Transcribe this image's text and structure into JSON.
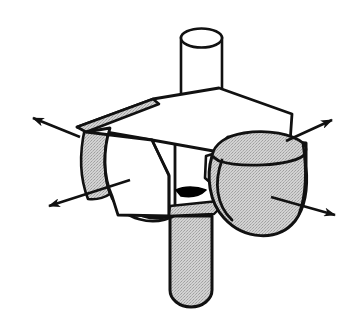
{
  "figure": {
    "background_color": "#ffffff",
    "outline_color": "#111111",
    "shade_fill_color": "#cccccc",
    "highlight_fill_color": "#ffffff",
    "notch_fill_color": "#000000",
    "canvas": {
      "width": 364,
      "height": 324
    },
    "parts": [
      {
        "name": "top-cylinder",
        "label": "Top cylindrical boss",
        "fill": "#ffffff",
        "shaded": false,
        "description": "Vertical cylinder rising from the top face of the block, open elliptical top rim"
      },
      {
        "name": "block-top-face",
        "label": "Block top face",
        "fill": "#ffffff",
        "shaded": false,
        "description": "Upper parallelogram face of the rectangular block"
      },
      {
        "name": "block-back-ledge",
        "label": "Rear shaded ledge",
        "fill": "#cccccc",
        "shaded": true,
        "description": "Narrow grey sliver along the rear-left top edge of the block"
      },
      {
        "name": "block-front-face",
        "label": "Block front face",
        "fill": "#ffffff",
        "shaded": false,
        "description": "Front-facing vertical face of the rectangular block"
      },
      {
        "name": "block-right-face",
        "label": "Block right face",
        "fill": "#ffffff",
        "shaded": false,
        "description": "Right-facing vertical face of the rectangular block"
      },
      {
        "name": "left-dome",
        "label": "Left hemispherical bulge",
        "fill": "#ffffff",
        "shaded": false,
        "description": "Rounded dome protruding from the left side of the block"
      },
      {
        "name": "left-dome-shade",
        "label": "Left dome shaded crescent",
        "fill": "#cccccc",
        "shaded": true,
        "description": "Grey crescent along the far-left rim of the left dome"
      },
      {
        "name": "right-dome",
        "label": "Right hemispherical bulge",
        "fill": "#cccccc",
        "shaded": true,
        "description": "Large grey stippled dome protruding from the right side of the block"
      },
      {
        "name": "right-dome-cap",
        "label": "Right dome upper cap",
        "fill": "#cccccc",
        "shaded": true,
        "description": "Elliptical upper cap surface of the right dome"
      },
      {
        "name": "bottom-cylinder",
        "label": "Bottom cylindrical boss",
        "fill": "#cccccc",
        "shaded": true,
        "description": "Grey vertical cylinder descending from the underside of the block with a rounded end"
      },
      {
        "name": "center-notch",
        "label": "Centre notch wedge",
        "fill": "#000000",
        "shaded": false,
        "description": "Small solid black wedge where the front face meets the right dome"
      }
    ],
    "arrows": [
      {
        "name": "arrow-upper-left",
        "label": "Upper-left expansion arrow",
        "direction": "up-left",
        "from": [
          80,
          137
        ],
        "to": [
          29,
          116
        ]
      },
      {
        "name": "arrow-lower-left",
        "label": "Lower-left expansion arrow",
        "direction": "left",
        "from": [
          130,
          180
        ],
        "to": [
          45,
          207
        ]
      },
      {
        "name": "arrow-upper-right",
        "label": "Upper-right expansion arrow",
        "direction": "up-right",
        "from": [
          286,
          141
        ],
        "to": [
          336,
          118
        ]
      },
      {
        "name": "arrow-lower-right",
        "label": "Lower-right expansion arrow",
        "direction": "right",
        "from": [
          271,
          197
        ],
        "to": [
          339,
          216
        ]
      }
    ]
  }
}
